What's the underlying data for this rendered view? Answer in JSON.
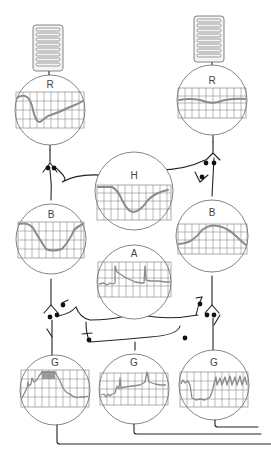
{
  "diagram": {
    "cells": [
      {
        "id": "receptor-left",
        "label": "R",
        "type": "receptor",
        "response": "hyperpolarizing transient then slow recovery"
      },
      {
        "id": "receptor-right",
        "label": "R",
        "type": "receptor",
        "response": "small sustained wave"
      },
      {
        "id": "horizontal",
        "label": "H",
        "type": "horizontal",
        "response": "sustained hyperpolarization"
      },
      {
        "id": "bipolar-left",
        "label": "B",
        "type": "bipolar",
        "response": "hyperpolarizing"
      },
      {
        "id": "bipolar-right",
        "label": "B",
        "type": "bipolar",
        "response": "depolarizing"
      },
      {
        "id": "amacrine",
        "label": "A",
        "type": "amacrine",
        "response": "transient on/off spikes"
      },
      {
        "id": "ganglion-left",
        "label": "G",
        "type": "ganglion",
        "response": "burst of spikes during light"
      },
      {
        "id": "ganglion-middle",
        "label": "G",
        "type": "ganglion",
        "response": "on-off transient spikes"
      },
      {
        "id": "ganglion-right",
        "label": "G",
        "type": "ganglion",
        "response": "suppressed then spiking"
      }
    ]
  },
  "labels": {
    "r_left": "R",
    "r_right": "R",
    "h": "H",
    "b_left": "B",
    "b_right": "B",
    "a": "A",
    "g_left": "G",
    "g_mid": "G",
    "g_right": "G"
  },
  "colors": {
    "trace": "#8a8a8a",
    "grid": "#777777",
    "wire": "#222222",
    "synapse": "#111111"
  }
}
